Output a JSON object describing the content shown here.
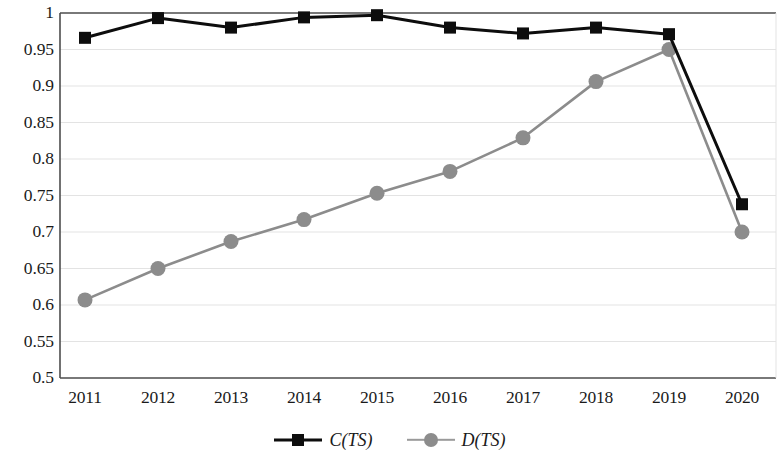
{
  "chart_data": {
    "type": "line",
    "title": "",
    "subtitle": "",
    "xlabel": "",
    "ylabel": "",
    "categories": [
      "2011",
      "2012",
      "2013",
      "2014",
      "2015",
      "2016",
      "2017",
      "2018",
      "2019",
      "2020"
    ],
    "x": [
      2011,
      2012,
      2013,
      2014,
      2015,
      2016,
      2017,
      2018,
      2019,
      2020
    ],
    "ylim": [
      0.5,
      1.0
    ],
    "ytick_labels": [
      "1",
      "0.95",
      "0.9",
      "0.85",
      "0.8",
      "0.75",
      "0.7",
      "0.65",
      "0.6",
      "0.55",
      "0.5"
    ],
    "ytick_values": [
      1,
      0.95,
      0.9,
      0.85,
      0.8,
      0.75,
      0.7,
      0.65,
      0.6,
      0.55,
      0.5
    ],
    "grid": true,
    "grid_axis": "y",
    "legend_position": "bottom",
    "series": [
      {
        "name": "C(TS)",
        "name_italic_part": "C",
        "name_paren_part": "(TS)",
        "marker": "square",
        "color": "#0d0d0d",
        "values": [
          0.966,
          0.993,
          0.98,
          0.994,
          0.997,
          0.98,
          0.972,
          0.98,
          0.971,
          0.738
        ]
      },
      {
        "name": "D(TS)",
        "name_italic_part": "D",
        "name_paren_part": "(TS)",
        "marker": "circle",
        "color": "#8c8c8c",
        "values": [
          0.607,
          0.65,
          0.687,
          0.717,
          0.753,
          0.783,
          0.829,
          0.906,
          0.95,
          0.7
        ]
      }
    ]
  },
  "axes": {
    "frame_color": "#4d4d4d",
    "grid_color": "#e3e3e3"
  }
}
